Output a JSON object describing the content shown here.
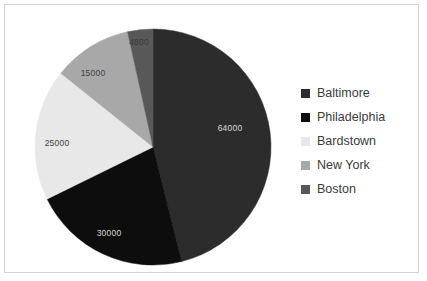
{
  "chart_data": {
    "type": "pie",
    "title": "",
    "categories": [
      "Baltimore",
      "Philadelphia",
      "Bardstown",
      "New York",
      "Boston"
    ],
    "values": [
      64000,
      30000,
      25000,
      15000,
      4800
    ],
    "value_labels": [
      "64000",
      "30000",
      "25000",
      "15000",
      "4800"
    ],
    "colors": [
      "#2c2c2c",
      "#0d0d0d",
      "#e8e8e8",
      "#a8a8a8",
      "#585858"
    ],
    "label_colors": [
      "#d8d8d8",
      "#d8d8d8",
      "#404040",
      "#404040",
      "#3a3a3a"
    ],
    "legend_position": "right",
    "start_angle_deg": 0,
    "direction": "clockwise",
    "total": 138800,
    "slices": [
      {
        "name": "Baltimore",
        "value": 64000,
        "label": "64000",
        "color": "#2c2c2c",
        "label_color": "#d8d8d8",
        "label_x": 225,
        "label_y": 124
      },
      {
        "name": "Philadelphia",
        "value": 30000,
        "label": "30000",
        "color": "#0d0d0d",
        "label_color": "#d8d8d8",
        "label_x": 104,
        "label_y": 229
      },
      {
        "name": "Bardstown",
        "value": 25000,
        "label": "25000",
        "color": "#e8e8e8",
        "label_color": "#404040",
        "label_x": 52,
        "label_y": 139
      },
      {
        "name": "New York",
        "value": 15000,
        "label": "15000",
        "color": "#a8a8a8",
        "label_color": "#404040",
        "label_x": 88,
        "label_y": 69
      },
      {
        "name": "Boston",
        "value": 4800,
        "label": "4800",
        "color": "#585858",
        "label_color": "#3a3a3a",
        "label_x": 134,
        "label_y": 38
      }
    ],
    "geometry": {
      "cx": 148,
      "cy": 142,
      "r": 118
    }
  },
  "legend": {
    "items": [
      {
        "label": "Baltimore",
        "color": "#2c2c2c"
      },
      {
        "label": "Philadelphia",
        "color": "#0d0d0d"
      },
      {
        "label": "Bardstown",
        "color": "#e8e8e8"
      },
      {
        "label": "New York",
        "color": "#a8a8a8"
      },
      {
        "label": "Boston",
        "color": "#585858"
      }
    ]
  }
}
